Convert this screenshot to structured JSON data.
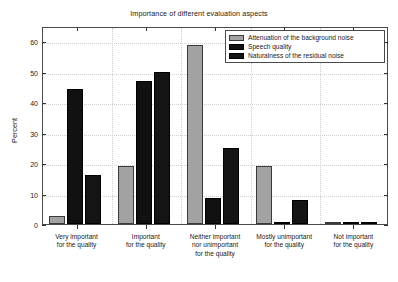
{
  "chart_data": {
    "type": "bar",
    "title": "Importance of different evaluation aspects",
    "xlabel": "",
    "ylabel": "Percent",
    "ylim": [
      0,
      65
    ],
    "yticks": [
      0,
      10,
      20,
      30,
      40,
      50,
      60
    ],
    "ytick_labels": [
      "0",
      "10",
      "20",
      "30",
      "40",
      "50",
      "60"
    ],
    "grid": true,
    "legend_position": "top-right",
    "categories": [
      "Very important\nfor the quality",
      "Important\nfor the quality",
      "Neither important\nnor unimportant\nfor the quality",
      "Mostly unimportant\nfor the quality",
      "Not important\nfor the quality"
    ],
    "category_lines": [
      [
        "Very important",
        "for the quality"
      ],
      [
        "Important",
        "for the quality"
      ],
      [
        "Neither important",
        "nor unimportant",
        "for the quality"
      ],
      [
        "Mostly unimportant",
        "for the quality"
      ],
      [
        "Not important",
        "for the quality"
      ]
    ],
    "series": [
      {
        "name": "Attenuation of the background noise",
        "color": "#a2a2a2",
        "values": [
          2.5,
          19,
          58.7,
          19,
          0.3
        ]
      },
      {
        "name": "Speech quality",
        "color": "#111111",
        "values": [
          44.4,
          47,
          8.5,
          0.3,
          0.3
        ]
      },
      {
        "name": "Naturalness of the residual noise",
        "color": "#141414",
        "values": [
          16,
          50,
          25,
          8,
          0.3
        ]
      }
    ]
  }
}
